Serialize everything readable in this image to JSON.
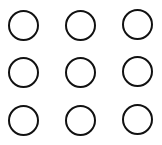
{
  "pattern_lock": {
    "rows": 3,
    "cols": 3,
    "stroke_color": "#111111",
    "background_color": "#ffffff",
    "nodes": [
      {
        "id": 1,
        "row": 0,
        "col": 0,
        "cx": 23,
        "cy": 25
      },
      {
        "id": 2,
        "row": 0,
        "col": 1,
        "cx": 80,
        "cy": 25
      },
      {
        "id": 3,
        "row": 0,
        "col": 2,
        "cx": 137,
        "cy": 24
      },
      {
        "id": 4,
        "row": 1,
        "col": 0,
        "cx": 23,
        "cy": 72
      },
      {
        "id": 5,
        "row": 1,
        "col": 1,
        "cx": 80,
        "cy": 72
      },
      {
        "id": 6,
        "row": 1,
        "col": 2,
        "cx": 137,
        "cy": 71
      },
      {
        "id": 7,
        "row": 2,
        "col": 0,
        "cx": 23,
        "cy": 120
      },
      {
        "id": 8,
        "row": 2,
        "col": 1,
        "cx": 80,
        "cy": 120
      },
      {
        "id": 9,
        "row": 2,
        "col": 2,
        "cx": 137,
        "cy": 119
      }
    ]
  }
}
